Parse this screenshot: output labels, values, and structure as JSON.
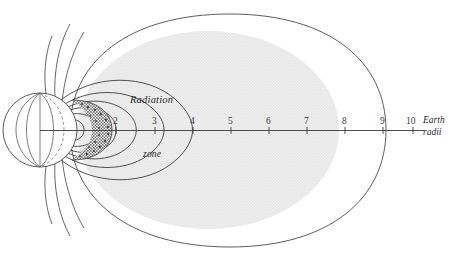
{
  "figure": {
    "type": "diagram",
    "labels": {
      "belt_line1": "Radiation",
      "belt_line2": "zone",
      "axis_unit_line1": "Earth",
      "axis_unit_line2": "radii"
    },
    "axis": {
      "orientation": "horizontal",
      "tick_labels": [
        "2",
        "3",
        "4",
        "5",
        "6",
        "7",
        "8",
        "9",
        "10"
      ],
      "tick_values": [
        2,
        3,
        4,
        5,
        6,
        7,
        8,
        9,
        10
      ],
      "unit": "Earth radii",
      "origin_label": ""
    },
    "regions": [
      {
        "name": "earth",
        "description": "sphere with meridian lines",
        "extent_earth_radii": 1
      },
      {
        "name": "inner-belt",
        "description": "dense dark stippled crescent",
        "extent_earth_radii": 2
      },
      {
        "name": "outer-belt",
        "description": "large light grey shaded zone",
        "extent_earth_radii": 8
      },
      {
        "name": "outer-boundary",
        "description": "thin outer contour line",
        "extent_earth_radii": 9
      }
    ],
    "colors": {
      "ink": "#3a3a3a",
      "outer_belt_fill": "#e3e3e3",
      "inner_belt_fill": "#8a8a8a",
      "earth_fill": "#ffffff",
      "background": "#ffffff"
    },
    "field_lines": {
      "closed_contours": 6,
      "open_polar_lines": 6
    }
  }
}
